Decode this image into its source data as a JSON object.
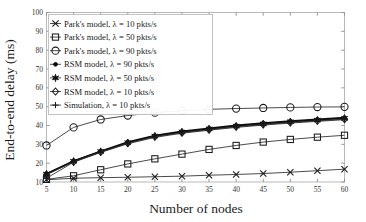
{
  "chart_data": {
    "type": "line",
    "title": "",
    "xlabel": "Number of nodes",
    "ylabel": "End-to-end delay (ms)",
    "xlim": [
      5,
      60
    ],
    "ylim": [
      10,
      100
    ],
    "xticks": [
      5,
      10,
      15,
      20,
      25,
      30,
      35,
      40,
      45,
      50,
      55,
      60
    ],
    "yticks": [
      10,
      20,
      30,
      40,
      50,
      60,
      70,
      80,
      90,
      100
    ],
    "xtick_labels": [
      "5",
      "10",
      "15",
      "20",
      "25",
      "30",
      "35",
      "40",
      "45",
      "50",
      "55",
      "60"
    ],
    "ytick_labels": [
      "10",
      "20",
      "30",
      "40",
      "50",
      "60",
      "70",
      "80",
      "90",
      "100"
    ],
    "grid": false,
    "legend_position": "upper left",
    "x": [
      5,
      10,
      15,
      20,
      25,
      30,
      35,
      40,
      45,
      50,
      55,
      60
    ],
    "series": [
      {
        "name": "Park's model, λ = 10 pkts/s",
        "marker": "x-marker",
        "values": [
          11.2,
          12.0,
          12.3,
          12.5,
          12.8,
          13.1,
          13.6,
          14.0,
          14.5,
          15.2,
          16.0,
          16.8
        ]
      },
      {
        "name": "Park's model, λ = 50 pkts/s",
        "marker": "square-marker",
        "values": [
          11.4,
          13.3,
          16.5,
          19.6,
          22.3,
          24.8,
          27.3,
          29.4,
          31.2,
          32.6,
          33.8,
          34.8
        ]
      },
      {
        "name": "Park's model, λ = 90 pkts/s",
        "marker": "circle-marker",
        "values": [
          29.4,
          39.0,
          43.2,
          45.3,
          46.8,
          47.9,
          48.6,
          49.0,
          49.3,
          49.6,
          49.8,
          49.9
        ]
      },
      {
        "name": "RSM model, λ = 90 pkts/s",
        "marker": "filled-dot-marker",
        "values": [
          14.4,
          21.2,
          26.4,
          31.2,
          34.7,
          36.9,
          38.6,
          40.1,
          41.3,
          42.4,
          43.3,
          44.2
        ]
      },
      {
        "name": "RSM model, λ = 50 pkts/s",
        "marker": "filled-star-marker",
        "values": [
          14.2,
          21.0,
          26.2,
          30.9,
          34.4,
          36.6,
          38.2,
          39.7,
          40.9,
          42.0,
          42.9,
          43.8
        ]
      },
      {
        "name": "RSM model, λ = 10 pkts/s",
        "marker": "open-diamond-marker",
        "values": [
          13.9,
          20.7,
          25.9,
          30.6,
          34.0,
          36.2,
          37.8,
          39.3,
          40.5,
          41.6,
          42.5,
          43.4
        ]
      },
      {
        "name": "Simulation, λ = 10 pkts/s",
        "marker": "plus-marker",
        "values": [
          12.0,
          20.5,
          25.7,
          30.3,
          33.7,
          35.9,
          37.5,
          39.0,
          40.2,
          41.3,
          42.2,
          43.1
        ]
      }
    ]
  },
  "legend": {
    "items": [
      {
        "label": "Park's model, λ = 10 pkts/s",
        "marker": "x-marker"
      },
      {
        "label": "Park's model, λ = 50 pkts/s",
        "marker": "square-marker"
      },
      {
        "label": "Park's model, λ = 90 pkts/s",
        "marker": "circle-marker"
      },
      {
        "label": "RSM model, λ = 90 pkts/s",
        "marker": "filled-dot-marker"
      },
      {
        "label": "RSM model, λ = 50 pkts/s",
        "marker": "filled-star-marker"
      },
      {
        "label": "RSM model, λ = 10 pkts/s",
        "marker": "open-diamond-marker"
      },
      {
        "label": "Simulation, λ = 10 pkts/s",
        "marker": "plus-marker"
      }
    ]
  },
  "colors": {
    "line": "#2a2a2a",
    "frame": "#b9b9b9",
    "text": "#1a1a1a",
    "background": "#ffffff"
  }
}
